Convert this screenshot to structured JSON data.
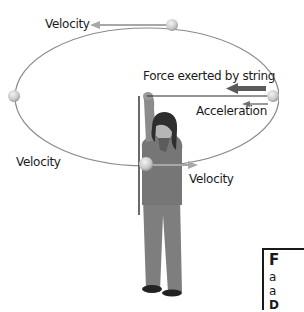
{
  "figure": {
    "type": "circular-motion-diagram",
    "labels": {
      "velocity_top": "Velocity",
      "force_string": "Force exerted by string",
      "acceleration": "Acceleration",
      "velocity_left": "Velocity",
      "velocity_bottom": "Velocity"
    },
    "colors": {
      "orbit": "#8a8a8a",
      "velocity_arrow": "#a8a8a8",
      "force_arrow": "#5a5a5a",
      "acceleration_arrow": "#6e6e6e",
      "string": "#2a2a2a",
      "ball": "#d6d6d6",
      "person_body": "#7a7a7a",
      "person_hair": "#2e2e2e"
    }
  },
  "caption": {
    "line1": "F",
    "line2": "a",
    "line3": "a",
    "line4": "D"
  }
}
